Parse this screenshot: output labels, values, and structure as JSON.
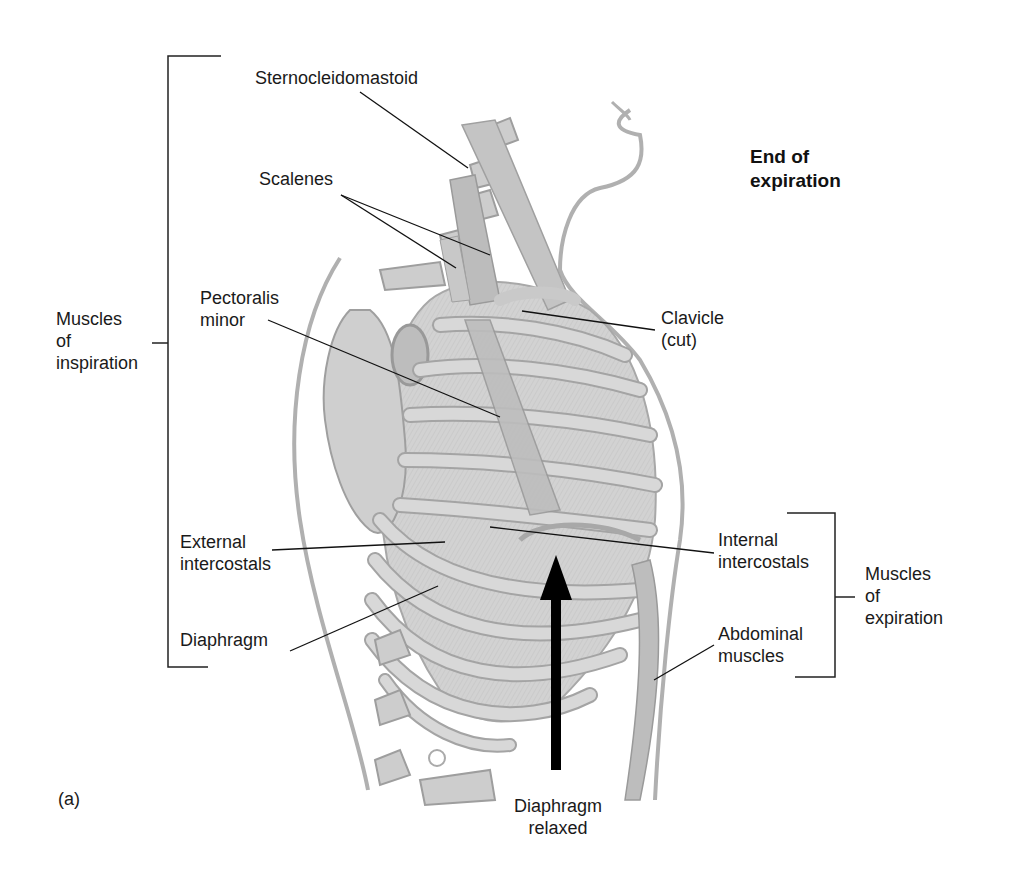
{
  "figure": {
    "panel_label": "(a)",
    "state_title_line1": "End of",
    "state_title_line2": "expiration",
    "arrow_caption_line1": "Diaphragm",
    "arrow_caption_line2": "relaxed",
    "arrow_direction": "up"
  },
  "groups": {
    "inspiration": {
      "line1": "Muscles",
      "line2": "of",
      "line3": "inspiration"
    },
    "expiration": {
      "line1": "Muscles",
      "line2": "of",
      "line3": "expiration"
    }
  },
  "labels": {
    "sternocleidomastoid": "Sternocleidomastoid",
    "scalenes": "Scalenes",
    "pectoralis_line1": "Pectoralis",
    "pectoralis_line2": "minor",
    "clavicle_line1": "Clavicle",
    "clavicle_line2": "(cut)",
    "external_line1": "External",
    "external_line2": "intercostals",
    "diaphragm": "Diaphragm",
    "internal_line1": "Internal",
    "internal_line2": "intercostals",
    "abdominal_line1": "Abdominal",
    "abdominal_line2": "muscles"
  },
  "colors": {
    "background": "#ffffff",
    "text": "#1a1a1a",
    "illustration_fill": "#d4d4d4",
    "illustration_stroke": "#9a9a9a",
    "arrow": "#000000"
  }
}
